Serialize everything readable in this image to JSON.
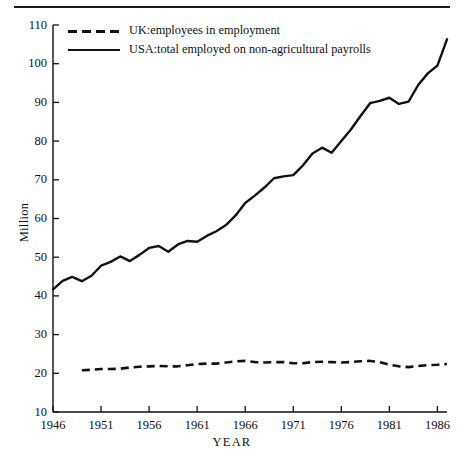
{
  "chart_data": {
    "type": "line",
    "title": "",
    "xlabel": "YEAR",
    "ylabel": "Million",
    "xlim": [
      1946,
      1987
    ],
    "ylim": [
      10,
      110
    ],
    "grid": false,
    "legend_position": "top-left",
    "x_ticks": [
      "1946",
      "1951",
      "1956",
      "1961",
      "1966",
      "1971",
      "1976",
      "1981",
      "1986"
    ],
    "x_tick_values": [
      1946,
      1951,
      1956,
      1961,
      1966,
      1971,
      1976,
      1981,
      1986
    ],
    "y_ticks": [
      "10",
      "20",
      "30",
      "40",
      "50",
      "60",
      "70",
      "80",
      "90",
      "100",
      "110"
    ],
    "y_tick_values": [
      10,
      20,
      30,
      40,
      50,
      60,
      70,
      80,
      90,
      100,
      110
    ],
    "series": [
      {
        "name": "UK:employees in employment",
        "style": "dashed",
        "x": [
          1949,
          1950,
          1951,
          1952,
          1953,
          1954,
          1955,
          1956,
          1957,
          1958,
          1959,
          1960,
          1961,
          1962,
          1963,
          1964,
          1965,
          1966,
          1967,
          1968,
          1969,
          1970,
          1971,
          1972,
          1973,
          1974,
          1975,
          1976,
          1977,
          1978,
          1979,
          1980,
          1981,
          1982,
          1983,
          1984,
          1985,
          1986,
          1987
        ],
        "values": [
          20.8,
          20.9,
          21.1,
          21.1,
          21.2,
          21.5,
          21.7,
          21.8,
          21.9,
          21.8,
          21.8,
          22.1,
          22.4,
          22.5,
          22.5,
          22.8,
          23.1,
          23.2,
          22.9,
          22.8,
          22.9,
          22.9,
          22.6,
          22.6,
          22.9,
          23.0,
          22.9,
          22.8,
          22.9,
          23.1,
          23.2,
          22.9,
          22.2,
          21.8,
          21.6,
          21.9,
          22.1,
          22.2,
          22.4
        ]
      },
      {
        "name": "USA:total employed on non-agricultural payrolls",
        "style": "solid",
        "x": [
          1946,
          1947,
          1948,
          1949,
          1950,
          1951,
          1952,
          1953,
          1954,
          1955,
          1956,
          1957,
          1958,
          1959,
          1960,
          1961,
          1962,
          1963,
          1964,
          1965,
          1966,
          1967,
          1968,
          1969,
          1970,
          1971,
          1972,
          1973,
          1974,
          1975,
          1976,
          1977,
          1978,
          1979,
          1980,
          1981,
          1982,
          1983,
          1984,
          1985,
          1986,
          1987
        ],
        "values": [
          41.7,
          43.9,
          44.9,
          43.8,
          45.2,
          47.8,
          48.8,
          50.2,
          49.0,
          50.6,
          52.4,
          52.9,
          51.4,
          53.3,
          54.2,
          54.0,
          55.5,
          56.7,
          58.3,
          60.8,
          64.0,
          65.9,
          68.0,
          70.4,
          70.9,
          71.2,
          73.7,
          76.8,
          78.3,
          77.0,
          80.0,
          83.0,
          86.5,
          89.8,
          90.4,
          91.2,
          89.6,
          90.2,
          94.5,
          97.5,
          99.5,
          106.3
        ]
      }
    ]
  }
}
